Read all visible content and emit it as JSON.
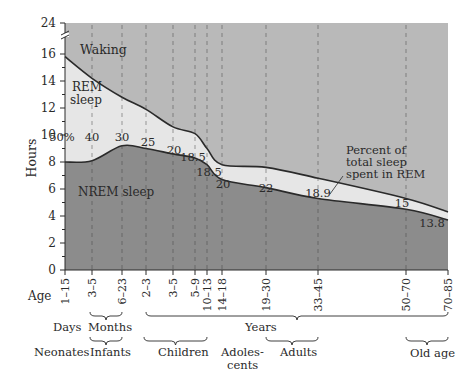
{
  "chart_data": {
    "type": "area",
    "title": "",
    "xlabel": "Age",
    "ylabel": "Hours",
    "y_ticks": [
      "0",
      "2",
      "4",
      "6",
      "8",
      "10",
      "12",
      "14",
      "16",
      "24"
    ],
    "y_axis_break": "between 16 and 24",
    "ylim": [
      0,
      24
    ],
    "grid": "vertical dashed lines at each age group",
    "categories": [
      "1–15",
      "3–5",
      "6–23",
      "2–3",
      "3–5",
      "5–9",
      "10–13",
      "14–18",
      "19–30",
      "33–45",
      "50–70",
      "70–85"
    ],
    "series": [
      {
        "name": "Total sleep (NREM + REM)",
        "values": [
          15.8,
          14.2,
          12.8,
          11.9,
          10.6,
          10.1,
          9.0,
          7.8,
          7.6,
          6.8,
          5.3,
          4.3
        ]
      },
      {
        "name": "NREM sleep",
        "values": [
          8.0,
          8.1,
          9.2,
          9.0,
          8.6,
          8.3,
          7.8,
          6.7,
          6.1,
          5.3,
          4.5,
          3.7
        ]
      }
    ],
    "rem_percent_labels": [
      "50%",
      "40",
      "30",
      "25",
      "20",
      "18.5",
      "18.5",
      "20",
      "22",
      "18.9",
      "15",
      "13.8"
    ],
    "regions": [
      "Waking",
      "REM sleep",
      "NREM sleep"
    ],
    "annotation": "Percent of total sleep spent in REM",
    "age_units": [
      {
        "label": "Days",
        "span": [
          "1–15",
          "1–15"
        ]
      },
      {
        "label": "Months",
        "span": [
          "3–5",
          "6–23"
        ]
      },
      {
        "label": "Years",
        "span": [
          "2–3",
          "70–85"
        ]
      }
    ],
    "life_stages": [
      {
        "label": "Neonates",
        "span": [
          "1–15",
          "1–15"
        ]
      },
      {
        "label": "Infants",
        "span": [
          "3–5",
          "6–23"
        ]
      },
      {
        "label": "Children",
        "span": [
          "2–3",
          "10–13"
        ]
      },
      {
        "label": "Adoles-\ncents",
        "span": [
          "14–18",
          "14–18"
        ]
      },
      {
        "label": "Adults",
        "span": [
          "19–30",
          "33–45"
        ]
      },
      {
        "label": "Old age",
        "span": [
          "50–70",
          "70–85"
        ]
      }
    ],
    "colors": {
      "waking": "#b9b9b9",
      "rem": "#e6e6e6",
      "nrem": "#8c8c8c",
      "line": "#2a2a2a"
    }
  },
  "labels": {
    "waking": "Waking",
    "rem_line1": "REM",
    "rem_line2": "sleep",
    "nrem": "NREM sleep",
    "ylabel": "Hours",
    "age": "Age",
    "annot1": "Percent of",
    "annot2": "total sleep",
    "annot3": "spent in REM",
    "days": "Days",
    "months": "Months",
    "years": "Years",
    "neonates": "Neonates",
    "infants": "Infants",
    "children": "Children",
    "adol1": "Adoles-",
    "adol2": "cents",
    "adults": "Adults",
    "old_age": "Old age"
  }
}
